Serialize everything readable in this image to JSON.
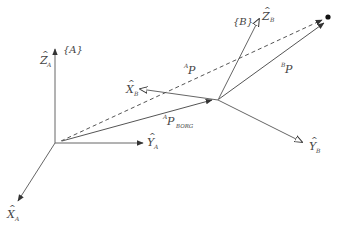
{
  "diagram": {
    "title": "",
    "colors": {
      "line": "#555555",
      "text": "#444444",
      "point": "#111111",
      "background": "#ffffff"
    },
    "frames": [
      {
        "id": "A",
        "label": "{A}",
        "origin": [
          55,
          143
        ],
        "axes": {
          "Z": {
            "hat": "^",
            "letter": "Z",
            "subscript": "A"
          },
          "Y": {
            "hat": "^",
            "letter": "Y",
            "subscript": "A"
          },
          "X": {
            "hat": "^",
            "letter": "X",
            "subscript": "A"
          }
        }
      },
      {
        "id": "B",
        "label": "{B}",
        "origin": [
          218,
          100
        ],
        "axes": {
          "Z": {
            "hat": "^",
            "letter": "Z",
            "subscript": "B"
          },
          "Y": {
            "hat": "^",
            "letter": "Y",
            "subscript": "B"
          },
          "X": {
            "hat": "^",
            "letter": "X",
            "subscript": "B"
          }
        }
      }
    ],
    "vectors": [
      {
        "id": "AP",
        "superscript": "A",
        "letter": "P",
        "subscript": "",
        "style": "dashed"
      },
      {
        "id": "BP",
        "superscript": "B",
        "letter": "P",
        "subscript": "",
        "style": "solid"
      },
      {
        "id": "APBORG",
        "superscript": "A",
        "letter": "P",
        "subscript": "BORG",
        "style": "solid"
      }
    ],
    "point": {
      "label": "",
      "position": [
        328,
        17
      ]
    }
  }
}
